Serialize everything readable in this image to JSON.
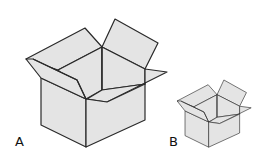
{
  "figure": {
    "boxes": [
      {
        "id": "A",
        "label": "A",
        "size": "large"
      },
      {
        "id": "B",
        "label": "B",
        "size": "small"
      }
    ],
    "colors": {
      "box_fill": "#e4e4e4",
      "outline": "#2a2a2a",
      "background": "#ffffff"
    }
  }
}
